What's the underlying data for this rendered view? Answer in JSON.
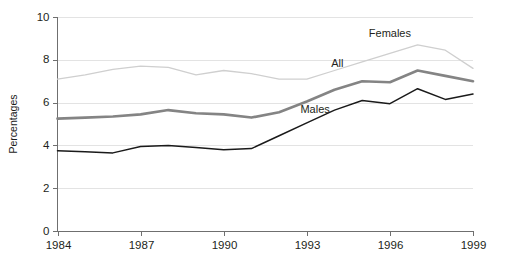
{
  "chart_data": {
    "type": "line",
    "title": "",
    "xlabel": "",
    "ylabel": "Percentages",
    "xlim": [
      1984,
      1999
    ],
    "ylim": [
      0,
      10
    ],
    "grid": true,
    "grid_axis": "y",
    "legend_position": "inline-labels",
    "x": [
      1984,
      1985,
      1986,
      1987,
      1988,
      1989,
      1990,
      1991,
      1992,
      1993,
      1994,
      1995,
      1996,
      1997,
      1998,
      1999
    ],
    "xticks": [
      "1984",
      "1987",
      "1990",
      "1993",
      "1996",
      "1999"
    ],
    "xtick_values": [
      1984,
      1987,
      1990,
      1993,
      1996,
      1999
    ],
    "yticks": [
      "0",
      "2",
      "4",
      "6",
      "8",
      "10"
    ],
    "ytick_values": [
      0,
      2,
      4,
      6,
      8,
      10
    ],
    "series": [
      {
        "name": "Females",
        "color": "#cfcfcf",
        "width": 1.3,
        "label": "Females",
        "label_x": 1996.0,
        "label_y": 9.05,
        "values": [
          7.1,
          7.3,
          7.55,
          7.7,
          7.65,
          7.3,
          7.5,
          7.35,
          7.1,
          7.1,
          7.5,
          7.9,
          8.3,
          8.7,
          8.45,
          7.6
        ]
      },
      {
        "name": "All",
        "color": "#848484",
        "width": 2.6,
        "label": "All",
        "label_x": 1994.1,
        "label_y": 7.65,
        "values": [
          5.25,
          5.3,
          5.35,
          5.45,
          5.65,
          5.5,
          5.45,
          5.3,
          5.55,
          6.05,
          6.6,
          7.0,
          6.95,
          7.5,
          7.25,
          7.0
        ]
      },
      {
        "name": "Males",
        "color": "#1a1a1a",
        "width": 1.5,
        "label": "Males",
        "label_x": 1993.3,
        "label_y": 5.5,
        "values": [
          3.75,
          3.7,
          3.65,
          3.95,
          4.0,
          3.9,
          3.8,
          3.85,
          4.45,
          5.05,
          5.65,
          6.1,
          5.95,
          6.65,
          6.15,
          6.4
        ]
      }
    ]
  }
}
